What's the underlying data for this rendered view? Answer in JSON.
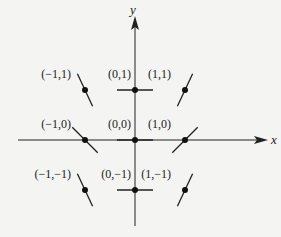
{
  "diagram": {
    "type": "slope-field",
    "axes": {
      "x_label": "x",
      "y_label": "y"
    },
    "points": [
      {
        "label": "(−1,1)",
        "x": -1,
        "y": 1,
        "angle_deg": -65
      },
      {
        "label": "(0,1)",
        "x": 0,
        "y": 1,
        "angle_deg": 0
      },
      {
        "label": "(1,1)",
        "x": 1,
        "y": 1,
        "angle_deg": 65
      },
      {
        "label": "(−1,0)",
        "x": -1,
        "y": 0,
        "angle_deg": -45
      },
      {
        "label": "(0,0)",
        "x": 0,
        "y": 0,
        "angle_deg": 0
      },
      {
        "label": "(1,0)",
        "x": 1,
        "y": 0,
        "angle_deg": 45
      },
      {
        "label": "(−1,−1)",
        "x": -1,
        "y": -1,
        "angle_deg": -65
      },
      {
        "label": "(0,−1)",
        "x": 0,
        "y": -1,
        "angle_deg": 0
      },
      {
        "label": "(1,−1)",
        "x": 1,
        "y": -1,
        "angle_deg": 65
      }
    ]
  }
}
